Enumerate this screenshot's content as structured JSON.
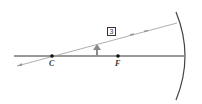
{
  "diagram": {
    "type": "concave-mirror-ray-diagram",
    "labels": {
      "center_of_curvature": "C",
      "focal_point": "F",
      "ray_number": "3"
    },
    "colors": {
      "axis": "#333333",
      "ray": "#9a9a9a",
      "mirror": "#444444",
      "object": "#8a8a8a"
    }
  }
}
